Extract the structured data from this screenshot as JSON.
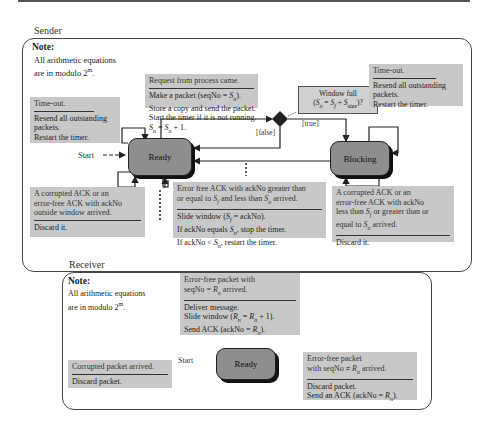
{
  "sender": {
    "title": "Sender",
    "note": {
      "title": "Note:",
      "lines": [
        "All arithmetic equations",
        "are in modulo 2^m."
      ]
    },
    "states": {
      "ready": "Ready",
      "blocking": "Blocking"
    },
    "start_label": "Start",
    "decision": {
      "true_label": "[true]",
      "false_label": "[false]",
      "condition_line1": "Window full",
      "condition_line2": "(Sn = Sf + Ssize)?"
    },
    "transitions": {
      "request": {
        "event": "Request from process came.",
        "actions": [
          "Make a packet (seqNo = Sn).",
          "Store a copy and send the packet.",
          "Start the timer if it is not running.",
          "Sn = Sn + 1."
        ]
      },
      "timeout_ready": {
        "event": "Time-out.",
        "actions": [
          "Resend all outstanding",
          "packets.",
          "Restart the timer."
        ]
      },
      "timeout_blocking": {
        "event": "Time-out.",
        "actions": [
          "Resend all outstanding",
          "packets.",
          "Restart the timer."
        ]
      },
      "corrupt_ready": {
        "event_lines": [
          "A corrupted ACK or an",
          "error-free ACK with ackNo",
          "outside window arrived."
        ],
        "actions": [
          "Discard it."
        ]
      },
      "errorfree_ack": {
        "event_lines": [
          "Error free ACK with ackNo greater than",
          "or equal to Sf and less than Sn arrived."
        ],
        "actions": [
          "Slide window (Sf = ackNo).",
          "If ackNo equals Sn, stop the timer.",
          "If ackNo < Sn, restart the timer."
        ]
      },
      "corrupt_blocking": {
        "event_lines": [
          "A corrupted ACK or an",
          "error-free ACK with ackNo",
          "less than Sf or greater than or",
          "equal to Sn arrived."
        ],
        "actions": [
          "Discard it."
        ]
      }
    }
  },
  "receiver": {
    "title": "Receiver",
    "note": {
      "title": "Note:",
      "lines": [
        "All arithmetic equations",
        "are in modulo 2^m."
      ]
    },
    "states": {
      "ready": "Ready"
    },
    "start_label": "Start",
    "transitions": {
      "errorfree_match": {
        "event_lines": [
          "Error-free packet with",
          "seqNo = Rn arrived."
        ],
        "actions": [
          "Deliver message.",
          "Slide window (Rn = Rn + 1).",
          "Send ACK (ackNo = Rn)."
        ]
      },
      "corrupted": {
        "event_lines": [
          "Corrupted packet arrived."
        ],
        "actions": [
          "Discard packet."
        ]
      },
      "errorfree_nomatch": {
        "event_lines": [
          "Error-free packet",
          "with seqNo ≠ Rn arrived."
        ],
        "actions": [
          "Discard packet.",
          "Send an ACK (ackNo = Rn)."
        ]
      }
    }
  }
}
